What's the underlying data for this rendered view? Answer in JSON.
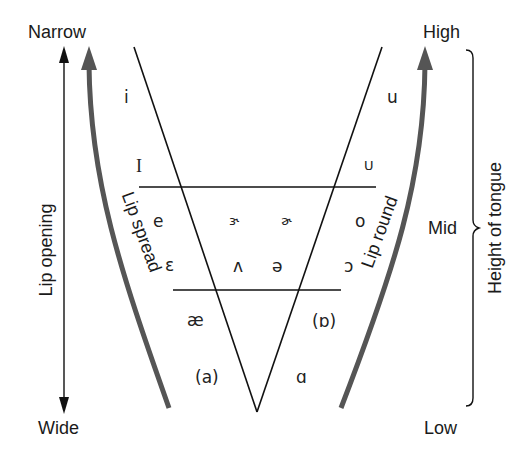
{
  "diagram": {
    "left_axis": {
      "top_label": "Narrow",
      "bottom_label": "Wide",
      "axis_label": "Lip opening"
    },
    "right_axis": {
      "top_label": "High",
      "middle_label": "Mid",
      "bottom_label": "Low",
      "axis_label": "Height of tongue"
    },
    "curves": {
      "left_curve_label": "Lip spread",
      "right_curve_label": "Lip round",
      "curve_color": "#555555"
    },
    "vowels": {
      "high_front": "i",
      "high_front_lax": "I",
      "high_back": "u",
      "high_back_lax": "U",
      "mid_front": "e",
      "mid_central_1": "ɝ",
      "mid_central_2": "ɚ",
      "mid_back": "o",
      "lower_mid_front": "ɛ",
      "lower_mid_central": "ʌ",
      "schwa": "ə",
      "lower_mid_back": "ɔ",
      "low_front": "æ",
      "low_back_round": "(ɒ)",
      "low_front_a": "(a)",
      "low_back": "ɑ"
    }
  }
}
